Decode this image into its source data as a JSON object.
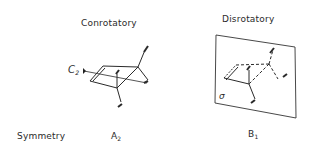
{
  "panels": [
    {
      "title": "Conrotatory",
      "axis_label": "C",
      "axis_sub": "2",
      "symmetry_main": "A",
      "symmetry_sub": "2"
    },
    {
      "title": "Disrotatory",
      "plane_label": "σ",
      "symmetry_main": "B",
      "symmetry_sub": "1"
    }
  ],
  "row_label": "Symmetry"
}
